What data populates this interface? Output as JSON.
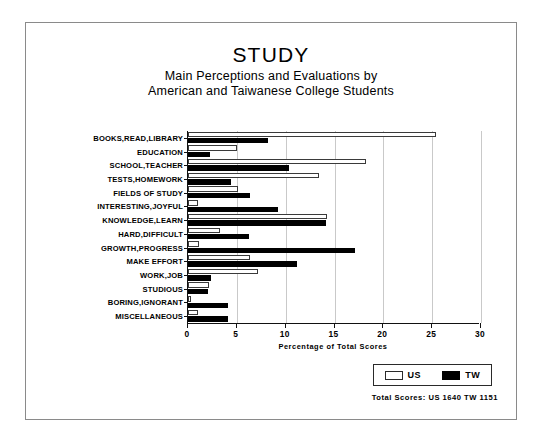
{
  "chart_data": {
    "type": "bar",
    "orientation": "horizontal",
    "title": "STUDY",
    "subtitle_line1": "Main Perceptions and Evaluations by",
    "subtitle_line2": "American and Taiwanese College Students",
    "xlabel": "Percentage of Total Scores",
    "ylabel": "",
    "xlim": [
      0,
      30
    ],
    "xticks": [
      0,
      5,
      10,
      15,
      20,
      25,
      30
    ],
    "xtick_labels": [
      "0",
      "5",
      "10",
      "15",
      "20",
      "25",
      "30"
    ],
    "grid": true,
    "grid_axis": "x",
    "legend_position": "bottom-right",
    "categories": [
      "BOOKS,READ,LIBRARY",
      "EDUCATION",
      "SCHOOL,TEACHER",
      "TESTS,HOMEWORK",
      "FIELDS OF STUDY",
      "INTERESTING,JOYFUL",
      "KNOWLEDGE,LEARN",
      "HARD,DIFFICULT",
      "GROWTH,PROGRESS",
      "MAKE EFFORT",
      "WORK,JOB",
      "STUDIOUS",
      "BORING,IGNORANT",
      "MISCELLANEOUS"
    ],
    "series": [
      {
        "name": "US",
        "color": "#ffffff",
        "values": [
          25.4,
          5.0,
          18.2,
          13.4,
          5.1,
          1.0,
          14.2,
          3.3,
          1.1,
          6.3,
          7.2,
          2.2,
          0.3,
          1.0
        ]
      },
      {
        "name": "TW",
        "color": "#000000",
        "values": [
          8.2,
          2.3,
          10.3,
          4.4,
          6.3,
          9.2,
          14.1,
          6.2,
          17.1,
          11.2,
          2.4,
          2.0,
          4.1,
          4.1
        ]
      }
    ],
    "annotation": "Total Scores:  US 1640   TW 1151"
  },
  "legend": {
    "entries": [
      {
        "label": "US",
        "style": "hollow"
      },
      {
        "label": "TW",
        "style": "solid"
      }
    ]
  }
}
